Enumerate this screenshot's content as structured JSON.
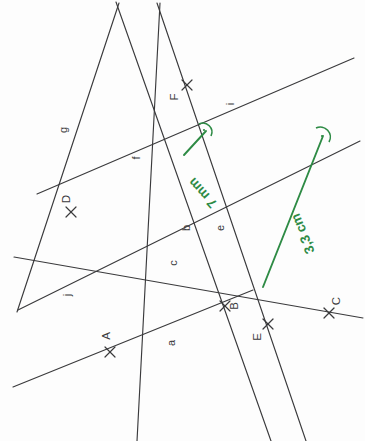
{
  "figure": {
    "width": 365,
    "height": 441,
    "background_color": "#fdfdfd",
    "line_color": "#3a3a3c",
    "measure_color": "#2e8b45"
  },
  "points": [
    {
      "id": "A",
      "label": "A",
      "x": 110,
      "y": 352,
      "label_x": 110,
      "label_y": 336
    },
    {
      "id": "B",
      "label": "B",
      "x": 225,
      "y": 306,
      "label_x": 238,
      "label_y": 306
    },
    {
      "id": "C",
      "label": "C",
      "x": 329,
      "y": 313,
      "label_x": 340,
      "label_y": 301
    },
    {
      "id": "D",
      "label": "D",
      "x": 71,
      "y": 212,
      "label_x": 70,
      "label_y": 199
    },
    {
      "id": "E",
      "label": "E",
      "x": 268,
      "y": 324,
      "label_x": 261,
      "label_y": 337
    },
    {
      "id": "F",
      "label": "F",
      "x": 187,
      "y": 85,
      "label_x": 178,
      "label_y": 97
    }
  ],
  "lines": [
    {
      "id": "a",
      "label": "a",
      "label_x": 175,
      "label_y": 343,
      "x1": 13,
      "y1": 387,
      "x2": 253,
      "y2": 290
    },
    {
      "id": "b",
      "label": "b",
      "label_x": 190,
      "label_y": 228,
      "x1": 116,
      "y1": 2,
      "x2": 271,
      "y2": 441
    },
    {
      "id": "c",
      "label": "c",
      "label_x": 177,
      "label_y": 263,
      "x1": 14,
      "y1": 257,
      "x2": 363,
      "y2": 318
    },
    {
      "id": "e",
      "label": "e",
      "label_x": 224,
      "label_y": 228,
      "x1": 157,
      "y1": 3,
      "x2": 306,
      "y2": 441
    },
    {
      "id": "f",
      "label": "f",
      "label_x": 140,
      "label_y": 158,
      "x1": 160,
      "y1": 3,
      "x2": 137,
      "y2": 441
    },
    {
      "id": "g",
      "label": "g",
      "label_x": 67,
      "label_y": 130,
      "x1": 119,
      "y1": 3,
      "x2": 17,
      "y2": 312
    },
    {
      "id": "i",
      "label": "i",
      "label_x": 234,
      "label_y": 104,
      "x1": 37,
      "y1": 194,
      "x2": 354,
      "y2": 58
    },
    {
      "id": "j",
      "label": "j",
      "label_x": 71,
      "label_y": 295,
      "x1": 18,
      "y1": 310,
      "x2": 360,
      "y2": 141
    }
  ],
  "measurements": [
    {
      "id": "seg-7mm",
      "label": "7 mm",
      "color": "#2e8b45",
      "x1": 184,
      "y1": 155,
      "x2": 206,
      "y2": 131,
      "label_x": 206,
      "label_y": 190,
      "right_angle": true
    },
    {
      "id": "seg-33cm",
      "label": "3,3 cm",
      "color": "#2e8b45",
      "x1": 263,
      "y1": 287,
      "x2": 323,
      "y2": 136,
      "label_x": 307,
      "label_y": 232,
      "right_angle": true
    }
  ]
}
